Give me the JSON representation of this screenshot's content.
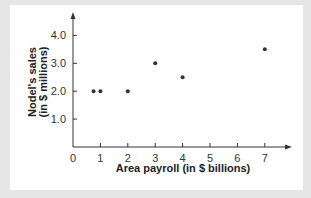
{
  "chart_data": {
    "type": "scatter",
    "title": "",
    "xlabel": "Area payroll (in $ billions)",
    "ylabel_lines": [
      "Nodel's sales",
      "(in $ millions)"
    ],
    "ylabel": "Nodel's sales (in $ millions)",
    "x_ticks": [
      "0",
      "1",
      "2",
      "3",
      "4",
      "5",
      "6",
      "7"
    ],
    "y_ticks": [
      "1.0",
      "2.0",
      "3.0",
      "4.0"
    ],
    "xlim": [
      0,
      8
    ],
    "ylim": [
      0,
      4.5
    ],
    "grid": false,
    "legend": null,
    "points": [
      {
        "x": 0.75,
        "y": 2.0
      },
      {
        "x": 1,
        "y": 2.0
      },
      {
        "x": 2,
        "y": 2.0
      },
      {
        "x": 3,
        "y": 3.0
      },
      {
        "x": 4,
        "y": 2.5
      },
      {
        "x": 7,
        "y": 3.5
      }
    ]
  },
  "colors": {
    "background": "#e6e6e6",
    "panel": "#ffffff",
    "axis": "#333333",
    "point": "#333333"
  }
}
